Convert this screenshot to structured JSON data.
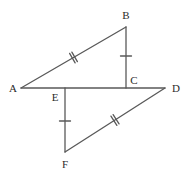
{
  "figure": {
    "kind": "geometry-diagram",
    "title": "",
    "background_color": "#ffffff",
    "stroke_color": "#595959",
    "label_color": "#2b2b2b",
    "stroke_width": 1.3,
    "width": 190,
    "height": 175
  },
  "points": {
    "A": {
      "label": "A",
      "x": 21,
      "y": 88,
      "label_x": 13,
      "label_y": 88
    },
    "B": {
      "label": "B",
      "x": 126,
      "y": 27,
      "label_x": 126,
      "label_y": 15
    },
    "C": {
      "label": "C",
      "x": 126,
      "y": 88,
      "label_x": 134,
      "label_y": 80
    },
    "D": {
      "label": "D",
      "x": 165,
      "y": 88,
      "label_x": 176,
      "label_y": 88
    },
    "E": {
      "label": "E",
      "x": 65,
      "y": 88,
      "label_x": 55,
      "label_y": 97
    },
    "F": {
      "label": "F",
      "x": 65,
      "y": 152,
      "label_x": 65,
      "label_y": 164
    }
  },
  "segments": [
    {
      "name": "segment-AD",
      "from": "A",
      "to": "D",
      "x1": 21,
      "y1": 88,
      "x2": 165,
      "y2": 88,
      "ticks": 0
    },
    {
      "name": "segment-AB",
      "from": "A",
      "to": "B",
      "x1": 21,
      "y1": 88,
      "x2": 126,
      "y2": 27,
      "ticks": 2
    },
    {
      "name": "segment-BC",
      "from": "B",
      "to": "C",
      "x1": 126,
      "y1": 27,
      "x2": 126,
      "y2": 88,
      "ticks": 1
    },
    {
      "name": "segment-EF",
      "from": "E",
      "to": "F",
      "x1": 65,
      "y1": 88,
      "x2": 65,
      "y2": 152,
      "ticks": 1
    },
    {
      "name": "segment-FD",
      "from": "F",
      "to": "D",
      "x1": 65,
      "y1": 152,
      "x2": 165,
      "y2": 88,
      "ticks": 2
    }
  ],
  "tick_marks": [
    {
      "name": "tick-mark-ab-double",
      "on_segment": "segment-AB",
      "count": 2,
      "cx": 73.5,
      "cy": 57.5,
      "angle_deg": -30.1,
      "length": 11
    },
    {
      "name": "tick-mark-bc-single",
      "on_segment": "segment-BC",
      "count": 1,
      "cx": 126,
      "cy": 56,
      "angle_deg": 90,
      "length": 11
    },
    {
      "name": "tick-mark-ef-single",
      "on_segment": "segment-EF",
      "count": 1,
      "cx": 65,
      "cy": 121,
      "angle_deg": 90,
      "length": 11
    },
    {
      "name": "tick-mark-fd-double",
      "on_segment": "segment-FD",
      "count": 2,
      "cx": 115,
      "cy": 120,
      "angle_deg": -32.6,
      "length": 11
    }
  ],
  "congruence": {
    "double_tick_pair": [
      "segment-AB",
      "segment-FD"
    ],
    "single_tick_pair": [
      "segment-BC",
      "segment-EF"
    ]
  }
}
